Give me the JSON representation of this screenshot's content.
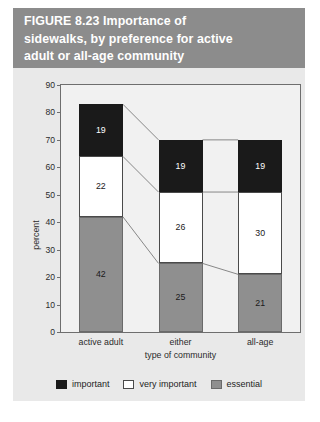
{
  "figure": {
    "banner_color": "#8c8c8c",
    "panel_color": "#e9e9e9",
    "title": "FIGURE 8.23  Importance of\nsidewalks, by preference for active\nadult or all-age community"
  },
  "chart_data": {
    "type": "bar",
    "stacked": true,
    "title": "FIGURE 8.23  Importance of sidewalks, by preference for active adult or all-age community",
    "xlabel": "type of community",
    "ylabel": "percent",
    "ylim": [
      0,
      90
    ],
    "ytick_step": 10,
    "yticks": [
      90,
      80,
      70,
      60,
      50,
      40,
      30,
      20,
      10,
      0
    ],
    "ytick_labels": [
      "90",
      "80",
      "70",
      "60",
      "50",
      "40",
      "30",
      "20",
      "10",
      "0"
    ],
    "grid": false,
    "legend_position": "bottom",
    "categories": [
      "active adult",
      "either",
      "all-age"
    ],
    "series": [
      {
        "name": "essential",
        "color": "#8f8f8f",
        "values": [
          42,
          25,
          21
        ]
      },
      {
        "name": "very important",
        "color": "#ffffff",
        "values": [
          22,
          26,
          30
        ]
      },
      {
        "name": "important",
        "color": "#1a1a1a",
        "values": [
          19,
          19,
          19
        ]
      }
    ],
    "stack_order_bottom_to_top": [
      "essential",
      "very important",
      "important"
    ],
    "totals": [
      83,
      70,
      70
    ],
    "bar_labels": {
      "active adult": {
        "essential": "42",
        "very important": "22",
        "important": "19"
      },
      "either": {
        "essential": "25",
        "very important": "26",
        "important": "19"
      },
      "all-age": {
        "essential": "21",
        "very important": "30",
        "important": "19"
      }
    },
    "connectors": true
  },
  "legend": {
    "items": [
      {
        "label": "important",
        "color": "#1a1a1a"
      },
      {
        "label": "very important",
        "color": "#ffffff"
      },
      {
        "label": "essential",
        "color": "#8f8f8f"
      }
    ]
  }
}
